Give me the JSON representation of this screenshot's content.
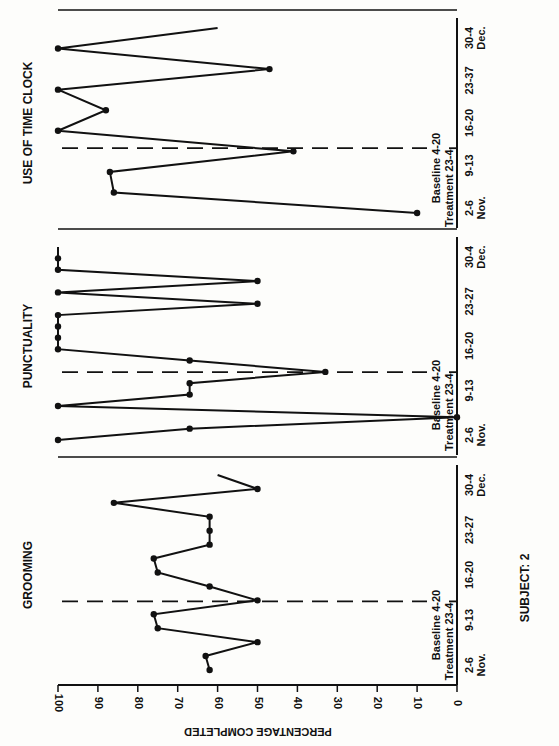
{
  "header_text": "",
  "chart_data": {
    "type": "line",
    "orientation": "rotated-90",
    "subject_label": "SUBJECT: 2",
    "xlabel": "PERCENTAGE COMPLETED",
    "value_axis": {
      "ticks": [
        "100",
        "90",
        "80",
        "70",
        "60",
        "50",
        "40",
        "30",
        "20",
        "10",
        "0"
      ],
      "range": [
        0,
        100
      ]
    },
    "date_ticks": [
      "2-6\nNov.",
      "9-13",
      "16-20",
      "23-27",
      "30-4\nDec."
    ],
    "date_tick_labels": [
      {
        "line1": "2-6",
        "line2": "Nov."
      },
      {
        "line1": "9-13",
        "line2": ""
      },
      {
        "line1": "16-20",
        "line2": ""
      },
      {
        "line1": "23-27",
        "line2": ""
      },
      {
        "line1": "30-4",
        "line2": "Dec."
      }
    ],
    "clock_date_tick_labels": [
      {
        "line1": "2-6",
        "line2": "Nov."
      },
      {
        "line1": "9-13",
        "line2": ""
      },
      {
        "line1": "16-20",
        "line2": ""
      },
      {
        "line1": "23-37",
        "line2": ""
      },
      {
        "line1": "30-4",
        "line2": "Dec."
      }
    ],
    "phase_labels": {
      "baseline": "Baseline 4-20",
      "treatment": "Treatment 23-4"
    },
    "panels": [
      {
        "title": "GROOMING",
        "values": [
          62,
          63,
          50,
          75,
          76,
          50,
          62,
          75,
          76,
          62,
          62,
          62,
          86,
          50,
          60
        ],
        "phase_change_after_index": 8
      },
      {
        "title": "PUNCTUALITY",
        "values": [
          100,
          67,
          0,
          100,
          67,
          67,
          33,
          67,
          100,
          100,
          100,
          100,
          50,
          100,
          50,
          100,
          100,
          100
        ],
        "phase_change_after_index": 8
      },
      {
        "title": "USE OF TIME CLOCK",
        "values": [
          10,
          86,
          87,
          41,
          100,
          88,
          100,
          47,
          100,
          60
        ],
        "phase_change_after_index": 0
      }
    ]
  }
}
